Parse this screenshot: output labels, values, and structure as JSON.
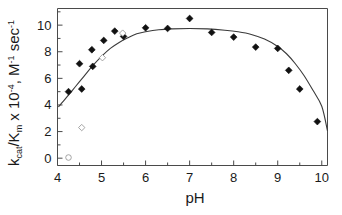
{
  "chart_data": {
    "type": "scatter",
    "title": "",
    "xlabel": "pH",
    "ylabel": "kcat/Km x 10-4, M-1 sec-1",
    "ylabel_parts": {
      "k": "k",
      "cat": "cat",
      "slash_K": "/K",
      "m": "m",
      "times": " x 10",
      "exp_minus4": "-4",
      "units_M": ", M",
      "exp_minus1a": "-1",
      "sec": "sec",
      "exp_minus1b": "-1",
      "space": " "
    },
    "xlim": [
      4,
      10.13
    ],
    "ylim": [
      -0.55,
      11.25
    ],
    "xticks": [
      4,
      5,
      6,
      7,
      8,
      9,
      10
    ],
    "xtick_labels": [
      "4",
      "5",
      "6",
      "7",
      "8",
      "9",
      "10"
    ],
    "xminor_ticks": [
      4.5,
      5.5,
      6.5,
      7.5,
      8.5,
      9.5
    ],
    "yticks": [
      0,
      2,
      4,
      6,
      8,
      10
    ],
    "ytick_labels": [
      "0",
      "2",
      "4",
      "6",
      "8",
      "10"
    ],
    "yminor_ticks": [
      1,
      3,
      5,
      7,
      9,
      11
    ],
    "grid": false,
    "legend": null,
    "series": [
      {
        "name": "filled-diamond-data",
        "marker": "filled-diamond",
        "color": "#111111",
        "points": [
          {
            "x": 4.25,
            "y": 5.0
          },
          {
            "x": 4.5,
            "y": 7.1
          },
          {
            "x": 4.55,
            "y": 5.2
          },
          {
            "x": 4.78,
            "y": 8.15
          },
          {
            "x": 4.8,
            "y": 6.9
          },
          {
            "x": 5.05,
            "y": 8.85
          },
          {
            "x": 5.3,
            "y": 9.55
          },
          {
            "x": 5.5,
            "y": 9.15
          },
          {
            "x": 6.0,
            "y": 9.8
          },
          {
            "x": 6.5,
            "y": 9.75
          },
          {
            "x": 7.0,
            "y": 10.5
          },
          {
            "x": 7.5,
            "y": 9.45
          },
          {
            "x": 8.0,
            "y": 9.1
          },
          {
            "x": 8.5,
            "y": 8.35
          },
          {
            "x": 9.0,
            "y": 8.25
          },
          {
            "x": 9.25,
            "y": 6.6
          },
          {
            "x": 9.5,
            "y": 5.2
          },
          {
            "x": 9.9,
            "y": 2.75
          }
        ]
      },
      {
        "name": "open-diamond-data",
        "marker": "open-diamond",
        "color": "#9a9a9a",
        "points": [
          {
            "x": 4.55,
            "y": 2.3
          },
          {
            "x": 5.02,
            "y": 7.55
          },
          {
            "x": 5.48,
            "y": 9.4
          }
        ]
      },
      {
        "name": "open-circle-data",
        "marker": "open-circle",
        "color": "#9a9a9a",
        "points": [
          {
            "x": 4.25,
            "y": 0.05
          }
        ]
      }
    ],
    "fit_curve": {
      "name": "bell-shaped-ph-fit",
      "color": "#3a3a3a",
      "points": [
        {
          "x": 4.02,
          "y": 3.85
        },
        {
          "x": 4.2,
          "y": 4.55
        },
        {
          "x": 4.4,
          "y": 5.35
        },
        {
          "x": 4.6,
          "y": 6.15
        },
        {
          "x": 4.8,
          "y": 6.95
        },
        {
          "x": 5.0,
          "y": 7.65
        },
        {
          "x": 5.2,
          "y": 8.25
        },
        {
          "x": 5.4,
          "y": 8.7
        },
        {
          "x": 5.6,
          "y": 9.05
        },
        {
          "x": 5.8,
          "y": 9.35
        },
        {
          "x": 6.0,
          "y": 9.5
        },
        {
          "x": 6.3,
          "y": 9.65
        },
        {
          "x": 6.6,
          "y": 9.72
        },
        {
          "x": 7.0,
          "y": 9.75
        },
        {
          "x": 7.4,
          "y": 9.72
        },
        {
          "x": 7.8,
          "y": 9.62
        },
        {
          "x": 8.1,
          "y": 9.5
        },
        {
          "x": 8.4,
          "y": 9.3
        },
        {
          "x": 8.7,
          "y": 8.95
        },
        {
          "x": 9.0,
          "y": 8.4
        },
        {
          "x": 9.2,
          "y": 7.85
        },
        {
          "x": 9.4,
          "y": 7.1
        },
        {
          "x": 9.6,
          "y": 6.2
        },
        {
          "x": 9.8,
          "y": 5.1
        },
        {
          "x": 10.0,
          "y": 3.9
        },
        {
          "x": 10.13,
          "y": 2.05
        }
      ]
    }
  }
}
